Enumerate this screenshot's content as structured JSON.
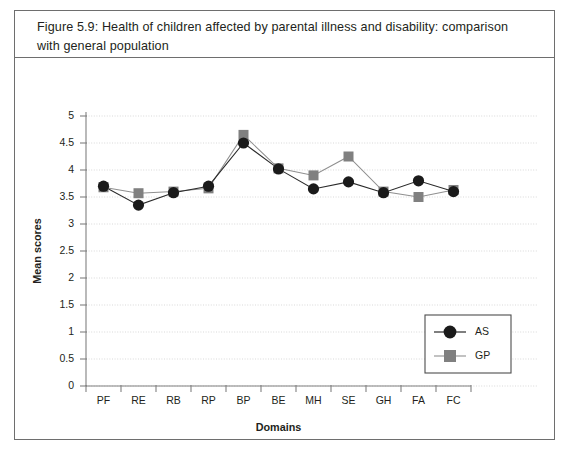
{
  "figure": {
    "caption": "Figure 5.9:  Health of children affected by parental illness and disability: comparison with general population"
  },
  "legend": {
    "position": "bottom-right",
    "entries": [
      {
        "label": "AS",
        "marker": "circle",
        "color": "#1a1a1a"
      },
      {
        "label": "GP",
        "marker": "square",
        "color": "#808080"
      }
    ]
  },
  "chart_data": {
    "type": "line",
    "title": "",
    "subtitle": "",
    "xlabel": "Domains",
    "ylabel": "Mean scores",
    "categories": [
      "PF",
      "RE",
      "RB",
      "RP",
      "BP",
      "BE",
      "MH",
      "SE",
      "GH",
      "FA",
      "FC"
    ],
    "ylim": [
      0,
      5
    ],
    "ytick_labels": [
      "0",
      "0.5",
      "1",
      "1.5",
      "2",
      "2.5",
      "3",
      "3.5",
      "4",
      "4.5",
      "5"
    ],
    "ytick_values": [
      0,
      0.5,
      1,
      1.5,
      2,
      2.5,
      3,
      3.5,
      4,
      4.5,
      5
    ],
    "grid": true,
    "legend_position": "bottom-right",
    "series": [
      {
        "name": "AS",
        "marker": "circle",
        "color": "#1a1a1a",
        "values": [
          3.7,
          3.35,
          3.58,
          3.7,
          4.5,
          4.02,
          3.65,
          3.78,
          3.58,
          3.8,
          3.6
        ]
      },
      {
        "name": "GP",
        "marker": "square",
        "color": "#808080",
        "values": [
          3.68,
          3.57,
          3.6,
          3.66,
          4.65,
          4.03,
          3.9,
          4.25,
          3.6,
          3.5,
          3.63
        ]
      }
    ]
  }
}
